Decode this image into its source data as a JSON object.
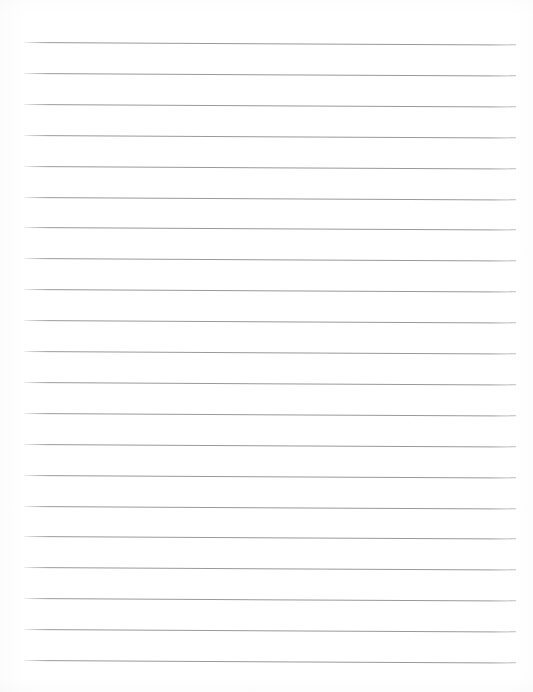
{
  "document": {
    "kind": "lined-paper",
    "title": "",
    "text_content": "",
    "page_width": 533,
    "page_height": 692,
    "background_color": "#ffffff"
  },
  "ruling": {
    "line_color": "#9a9a9e",
    "line_width_px": 1,
    "line_count": 21,
    "first_line_y": 42,
    "line_spacing_px": 30.9,
    "left_margin_x": 24,
    "right_margin_x": 516,
    "line_length_px": 492,
    "skew_drop_px": 2.5,
    "lines": [
      {
        "index": 1,
        "y": 42.0,
        "label": "rule-line-1"
      },
      {
        "index": 2,
        "y": 72.9,
        "label": "rule-line-2"
      },
      {
        "index": 3,
        "y": 103.8,
        "label": "rule-line-3"
      },
      {
        "index": 4,
        "y": 134.7,
        "label": "rule-line-4"
      },
      {
        "index": 5,
        "y": 165.6,
        "label": "rule-line-5"
      },
      {
        "index": 6,
        "y": 196.5,
        "label": "rule-line-6"
      },
      {
        "index": 7,
        "y": 227.4,
        "label": "rule-line-7"
      },
      {
        "index": 8,
        "y": 258.3,
        "label": "rule-line-8"
      },
      {
        "index": 9,
        "y": 289.2,
        "label": "rule-line-9"
      },
      {
        "index": 10,
        "y": 320.1,
        "label": "rule-line-10"
      },
      {
        "index": 11,
        "y": 351.0,
        "label": "rule-line-11"
      },
      {
        "index": 12,
        "y": 381.9,
        "label": "rule-line-12"
      },
      {
        "index": 13,
        "y": 412.8,
        "label": "rule-line-13"
      },
      {
        "index": 14,
        "y": 443.7,
        "label": "rule-line-14"
      },
      {
        "index": 15,
        "y": 474.6,
        "label": "rule-line-15"
      },
      {
        "index": 16,
        "y": 505.5,
        "label": "rule-line-16"
      },
      {
        "index": 17,
        "y": 536.4,
        "label": "rule-line-17"
      },
      {
        "index": 18,
        "y": 567.3,
        "label": "rule-line-18"
      },
      {
        "index": 19,
        "y": 598.2,
        "label": "rule-line-19"
      },
      {
        "index": 20,
        "y": 629.1,
        "label": "rule-line-20"
      },
      {
        "index": 21,
        "y": 660.0,
        "label": "rule-line-21"
      }
    ]
  }
}
